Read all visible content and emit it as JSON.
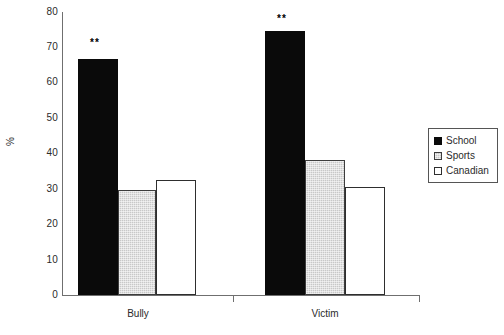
{
  "chart_data": {
    "type": "bar",
    "title": "",
    "xlabel": "",
    "ylabel": "%",
    "ylim": [
      0,
      80
    ],
    "ytick_step": 10,
    "yticks": [
      "80",
      "70",
      "60",
      "50",
      "40",
      "30",
      "20",
      "10",
      "0"
    ],
    "grid": false,
    "legend_position": "right",
    "categories": [
      "Bully",
      "Victim"
    ],
    "series": [
      {
        "name": "School",
        "color": "#0a0a0a",
        "values": [
          66.8,
          74.6
        ]
      },
      {
        "name": "Sports",
        "color": "#c8c8c8",
        "values": [
          29.8,
          38.2
        ]
      },
      {
        "name": "Canadian",
        "color": "#ffffff",
        "values": [
          32.6,
          30.5
        ]
      }
    ],
    "annotations": [
      {
        "text": "**",
        "category": "Bully",
        "series": "School"
      },
      {
        "text": "**",
        "category": "Victim",
        "series": "School"
      }
    ]
  },
  "axis": {
    "y_title": "%",
    "y_tick_80": "80",
    "y_tick_70": "70",
    "y_tick_60": "60",
    "y_tick_50": "50",
    "y_tick_40": "40",
    "y_tick_30": "30",
    "y_tick_20": "20",
    "y_tick_10": "10",
    "y_tick_0": "0"
  },
  "categories": {
    "bully": "Bully",
    "victim": "Victim"
  },
  "annotations": {
    "bully_school_sig": "**",
    "victim_school_sig": "**"
  },
  "legend": {
    "school": "School",
    "sports": "Sports",
    "canadian": "Canadian"
  }
}
